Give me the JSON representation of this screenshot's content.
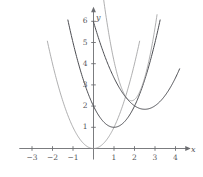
{
  "chart_data": {
    "type": "line",
    "title": "",
    "xlabel": "x",
    "ylabel": "y",
    "xlim": [
      -3.6,
      4.6
    ],
    "ylim": [
      -0.55,
      6.6
    ],
    "grid": false,
    "legend": "none",
    "x_ticks": [
      -3,
      -2,
      -1,
      1,
      2,
      3,
      4
    ],
    "y_ticks": [
      1,
      2,
      3,
      4,
      5,
      6
    ],
    "x_tick_labels": [
      "−3",
      "−2",
      "−1",
      "1",
      "2",
      "3",
      "4"
    ],
    "y_tick_labels": [
      "1",
      "2",
      "3",
      "4",
      "5",
      "6"
    ],
    "series": [
      {
        "name": "parabola-1",
        "equation": "y = x^2",
        "vertex": [
          0,
          0
        ],
        "a": 1,
        "color": "#9a9a9c",
        "width": 0.8,
        "x_start": -2.25,
        "x_end": 2.25
      },
      {
        "name": "parabola-2",
        "equation": "y = (x-1)^2 + 1",
        "vertex": [
          1,
          1
        ],
        "a": 1,
        "color": "#4c4d52",
        "width": 1.0,
        "x_start": -1.25,
        "x_end": 3.25
      },
      {
        "name": "parabola-3",
        "equation": "y = 2.6(x-1.85)^2 + 2.25",
        "vertex": [
          1.85,
          2.25
        ],
        "a": 2.6,
        "color": "#9a9a9c",
        "width": 0.8,
        "x_start": 0.0,
        "x_end": 3.1
      },
      {
        "name": "parabola-4",
        "equation": "y = 0.66(x-2.5)^2 + 1.85",
        "vertex": [
          2.5,
          1.85
        ],
        "a": 0.66,
        "color": "#4c4d52",
        "width": 1.0,
        "x_start": 0.0,
        "x_end": 4.2
      }
    ],
    "axis_color": "#6c6d71",
    "tick_color": "#6c6d71"
  }
}
